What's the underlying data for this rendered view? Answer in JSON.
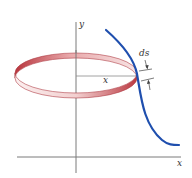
{
  "figure": {
    "labels": {
      "y_axis": "y",
      "x_axis": "x",
      "radius": "x",
      "arc_element": "ds"
    },
    "colors": {
      "curve": "#1f4fae",
      "band_dark": "#c0444a",
      "band_light": "#f4dcdc",
      "axes": "#777777",
      "radius_line": "#888888"
    }
  }
}
